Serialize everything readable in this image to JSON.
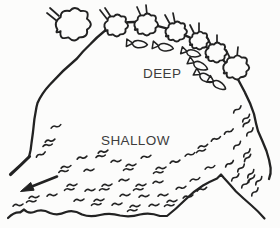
{
  "diagram": {
    "labels": {
      "deep": "DEEP",
      "shallow": "SHALLOW"
    },
    "colors": {
      "ink": "#222222",
      "paper": "#fcfcfb",
      "text": "#3d3d3d"
    },
    "outline": {
      "main": "M29,157 Q31,150 31.5,143 L33,132 Q34,119 36.5,107 L37.5,103 Q42,93 50,84.5 Q62,71 77,58.5 Q83,51 90,44.5 Q97,37 104,31.5 Q112,25.5 122,23.2 Q135,20.6 149,23.6 Q166,27.6 181,33.6 Q197,40 210,49.6 Q222,57.6 231,68.6 Q239,80 245,92.6 Q250.5,103 254,114 Q256,124 258,131 Q262.5,141 266.5,151 Q269.5,160 270.6,168 Q271.2,174 269,179",
      "left_kink": "M29.5,156.5 Q21,165 10.5,174.5",
      "shore": "M8,218 Q14,212 20,212.5 L24,209.5 Q28,214 34,212 Q42,208.5 50,213 Q58,216 66,212 Q74,209.5 82,214.5 Q90,217.5 100,215 Q110,212.5 120,215.5 Q130,217.5 140,214.5 Q150,212 160,216 L167,216 Q176,209 185,200 Q194,191 203,185.5 Q210,181.5 217,178.5 L221,174.5 L224,178 Q230,184.5 236,191.5 Q244,199 251,205 Q258,211 264.5,218.5"
    },
    "shapes": {
      "tree_blob": "M-10,3 Q-13,-2 -8,-5 Q-8,-10 -2,-9 Q1,-13 5,-9 Q11,-10 9,-4 Q14,0 9,3 Q10,8 4,8 Q1,12 -3,8 Q-9,10 -8,4 Q-12,6 -10,3 Z",
      "fish_body": "M11,0 Q8,-3.6 1,-3.8 Q-3.5,-3.8 -5,-0.2 Q-3.5,3.6 1,3.8 Q8,3.6 11,0 Z",
      "fish_tail": "M-4.5,-0.5 L-11,-4.5 L-11,3.5 Z",
      "marsh_single": "M0,1.2 Q2.2,-1.6 4.8,0.1 Q7.2,1.7 10,-1",
      "marsh_extra": "M-2.5,5.3 Q-0.3,2.8 2.2,4.2 Q4.6,5.6 7,3.6"
    },
    "trees": [
      {
        "x": 73,
        "y": 25,
        "s": 1.55,
        "stems": [
          [
            57,
            21,
            47,
            13
          ],
          [
            59,
            16,
            50,
            8
          ]
        ]
      },
      {
        "x": 116,
        "y": 26,
        "s": 1.05,
        "stems": [
          [
            107,
            19,
            100,
            10
          ],
          [
            111,
            17,
            105,
            8
          ]
        ]
      },
      {
        "x": 146,
        "y": 25,
        "s": 1.05,
        "stems": [
          [
            141,
            16,
            137,
            7
          ],
          [
            147,
            15,
            146,
            5
          ]
        ]
      },
      {
        "x": 176,
        "y": 32,
        "s": 0.95,
        "stems": [
          [
            170,
            24,
            165,
            15
          ],
          [
            175,
            23,
            173,
            13
          ]
        ]
      },
      {
        "x": 199,
        "y": 41,
        "s": 0.85,
        "stems": [
          [
            194,
            33,
            190,
            25
          ],
          [
            199,
            32,
            199,
            23
          ]
        ]
      },
      {
        "x": 216,
        "y": 53,
        "s": 0.95,
        "stems": [
          [
            211,
            45,
            207,
            37
          ],
          [
            217,
            44,
            217,
            35
          ]
        ]
      },
      {
        "x": 236,
        "y": 68,
        "s": 1.15,
        "stems": [
          [
            230,
            58,
            226,
            50
          ],
          [
            237,
            57,
            238,
            47
          ]
        ]
      }
    ],
    "fish": [
      {
        "x": 137,
        "y": 44,
        "r": 4,
        "s": 0.95
      },
      {
        "x": 163,
        "y": 47,
        "r": 9,
        "s": 0.95
      },
      {
        "x": 191,
        "y": 53,
        "r": 14,
        "s": 0.9
      },
      {
        "x": 198,
        "y": 65,
        "r": 24,
        "s": 0.95
      },
      {
        "x": 204,
        "y": 77,
        "r": 28,
        "s": 0.95
      },
      {
        "x": 217,
        "y": 84,
        "r": 30,
        "s": 0.9
      }
    ],
    "marsh": [
      {
        "x": 51,
        "y": 127,
        "r": -8,
        "t": 1
      },
      {
        "x": 45,
        "y": 141,
        "r": -5,
        "t": 2
      },
      {
        "x": 36,
        "y": 156,
        "r": -18,
        "t": 1
      },
      {
        "x": 61,
        "y": 167,
        "r": -3,
        "t": 2
      },
      {
        "x": 77,
        "y": 158,
        "r": -5,
        "t": 1
      },
      {
        "x": 84,
        "y": 170,
        "r": 0,
        "t": 1
      },
      {
        "x": 98,
        "y": 152,
        "r": -5,
        "t": 2
      },
      {
        "x": 111,
        "y": 161,
        "r": 0,
        "t": 1
      },
      {
        "x": 126,
        "y": 165,
        "r": 0,
        "t": 2
      },
      {
        "x": 141,
        "y": 157,
        "r": -4,
        "t": 1
      },
      {
        "x": 156,
        "y": 168,
        "r": 0,
        "t": 2
      },
      {
        "x": 170,
        "y": 162,
        "r": -5,
        "t": 1
      },
      {
        "x": 185,
        "y": 155,
        "r": -8,
        "t": 1
      },
      {
        "x": 198,
        "y": 147,
        "r": -10,
        "t": 2
      },
      {
        "x": 211,
        "y": 140,
        "r": -14,
        "t": 1
      },
      {
        "x": 224,
        "y": 133,
        "r": -18,
        "t": 1
      },
      {
        "x": 233,
        "y": 112,
        "r": -32,
        "t": 1
      },
      {
        "x": 242,
        "y": 121,
        "r": -36,
        "t": 2
      },
      {
        "x": 246,
        "y": 135,
        "r": -40,
        "t": 1
      },
      {
        "x": 233,
        "y": 148,
        "r": -36,
        "t": 1
      },
      {
        "x": 243,
        "y": 156,
        "r": -40,
        "t": 2
      },
      {
        "x": 225,
        "y": 166,
        "r": -28,
        "t": 1
      },
      {
        "x": 237,
        "y": 171,
        "r": -38,
        "t": 1
      },
      {
        "x": 247,
        "y": 177,
        "r": -42,
        "t": 2
      },
      {
        "x": 255,
        "y": 184,
        "r": -42,
        "t": 1
      },
      {
        "x": 241,
        "y": 187,
        "r": -36,
        "t": 1
      },
      {
        "x": 251,
        "y": 195,
        "r": -40,
        "t": 1
      },
      {
        "x": 231,
        "y": 180,
        "r": -33,
        "t": 1
      },
      {
        "x": 29,
        "y": 197,
        "r": 0,
        "t": 2
      },
      {
        "x": 47,
        "y": 195,
        "r": 0,
        "t": 1
      },
      {
        "x": 13,
        "y": 205,
        "r": 0,
        "t": 1
      },
      {
        "x": 67,
        "y": 185,
        "r": 0,
        "t": 2
      },
      {
        "x": 85,
        "y": 190,
        "r": 0,
        "t": 1
      },
      {
        "x": 102,
        "y": 185,
        "r": 0,
        "t": 2
      },
      {
        "x": 119,
        "y": 180,
        "r": 0,
        "t": 1
      },
      {
        "x": 136,
        "y": 185,
        "r": 0,
        "t": 2
      },
      {
        "x": 153,
        "y": 182,
        "r": 0,
        "t": 1
      },
      {
        "x": 74,
        "y": 200,
        "r": 0,
        "t": 1
      },
      {
        "x": 94,
        "y": 200,
        "r": 0,
        "t": 2
      },
      {
        "x": 112,
        "y": 204,
        "r": 0,
        "t": 1
      },
      {
        "x": 130,
        "y": 206,
        "r": 0,
        "t": 2
      },
      {
        "x": 149,
        "y": 205,
        "r": 0,
        "t": 1
      },
      {
        "x": 167,
        "y": 201,
        "r": 0,
        "t": 2
      },
      {
        "x": 183,
        "y": 197,
        "r": -6,
        "t": 1
      },
      {
        "x": 197,
        "y": 190,
        "r": -10,
        "t": 1
      },
      {
        "x": 120,
        "y": 195,
        "r": 0,
        "t": 1
      },
      {
        "x": 139,
        "y": 196,
        "r": 0,
        "t": 1
      },
      {
        "x": 158,
        "y": 195,
        "r": 0,
        "t": 1
      },
      {
        "x": 176,
        "y": 188,
        "r": -4,
        "t": 1
      },
      {
        "x": 190,
        "y": 180,
        "r": -8,
        "t": 1
      },
      {
        "x": 205,
        "y": 168,
        "r": -8,
        "t": 1
      }
    ],
    "arrow": {
      "line": [
        57,
        176.5,
        32.4,
        186.3
      ],
      "head_points": "20.5,191.5 30.7,182.4 34.1,190.2"
    }
  }
}
